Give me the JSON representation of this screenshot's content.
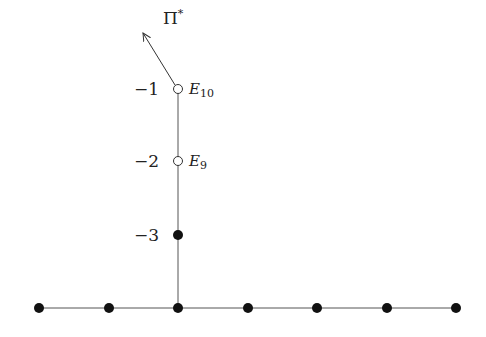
{
  "diagram": {
    "arrow_label": "Π",
    "arrow_label_sup": "*",
    "vertical_nodes": [
      {
        "weight": "−1",
        "name": "E",
        "sub": "10",
        "type": "open"
      },
      {
        "weight": "−2",
        "name": "E",
        "sub": "9",
        "type": "open"
      },
      {
        "weight": "−3",
        "name": "",
        "sub": "",
        "type": "filled"
      }
    ],
    "baseline_node_count": 7,
    "colors": {
      "line": "#555555",
      "node": "#111111",
      "text": "#222222"
    }
  }
}
